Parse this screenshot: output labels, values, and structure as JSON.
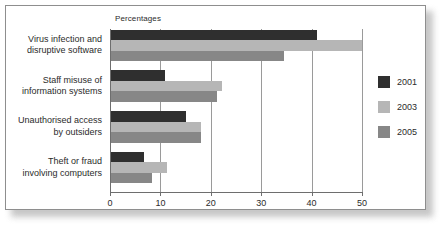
{
  "chart_data": {
    "type": "bar",
    "orientation": "horizontal",
    "title": "",
    "subtitle": "",
    "xlabel": "Percentages",
    "ylabel": "",
    "categories": [
      "Virus infection and disruptive software",
      "Staff misuse of information systems",
      "Unauthorised access by outsiders",
      "Theft or fraud involving computers"
    ],
    "category_lines": [
      [
        "Virus infection and",
        "disruptive software"
      ],
      [
        "Staff misuse of",
        "information systems"
      ],
      [
        "Unauthorised access",
        "by outsiders"
      ],
      [
        "Theft or fraud",
        "involving computers"
      ]
    ],
    "series": [
      {
        "name": "2001",
        "color": "#2f2f2f",
        "values": [
          41,
          11,
          15,
          6.7
        ]
      },
      {
        "name": "2003",
        "color": "#b6b6b6",
        "values": [
          50,
          22.3,
          18,
          11.4
        ]
      },
      {
        "name": "2005",
        "color": "#878787",
        "values": [
          34.6,
          21.3,
          18,
          8.4
        ]
      }
    ],
    "xlim": [
      0,
      50
    ],
    "xticks": [
      0,
      10,
      20,
      30,
      40,
      50
    ],
    "xtick_labels": [
      "0",
      "10",
      "20",
      "30",
      "40",
      "50"
    ],
    "grid": true,
    "grid_axis": "x",
    "legend": {
      "position": "right",
      "entries": [
        {
          "label": "2001",
          "color": "#2f2f2f"
        },
        {
          "label": "2003",
          "color": "#b6b6b6"
        },
        {
          "label": "2005",
          "color": "#878787"
        }
      ]
    }
  }
}
